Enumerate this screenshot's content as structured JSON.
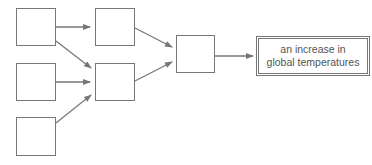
{
  "diagram": {
    "nodes": [
      {
        "id": "a1",
        "label": ""
      },
      {
        "id": "a2",
        "label": ""
      },
      {
        "id": "a3",
        "label": ""
      },
      {
        "id": "b1",
        "label": ""
      },
      {
        "id": "b2",
        "label": ""
      },
      {
        "id": "c1",
        "label": ""
      },
      {
        "id": "result",
        "label_line1": "an increase in",
        "label_line2": "global temperatures"
      }
    ],
    "edges": [
      {
        "from": "a1",
        "to": "b1"
      },
      {
        "from": "a1",
        "to": "b2"
      },
      {
        "from": "a2",
        "to": "b2"
      },
      {
        "from": "a3",
        "to": "b2"
      },
      {
        "from": "b1",
        "to": "c1"
      },
      {
        "from": "b2",
        "to": "c1"
      },
      {
        "from": "c1",
        "to": "result"
      }
    ],
    "colors": {
      "stroke": "#777777"
    }
  }
}
